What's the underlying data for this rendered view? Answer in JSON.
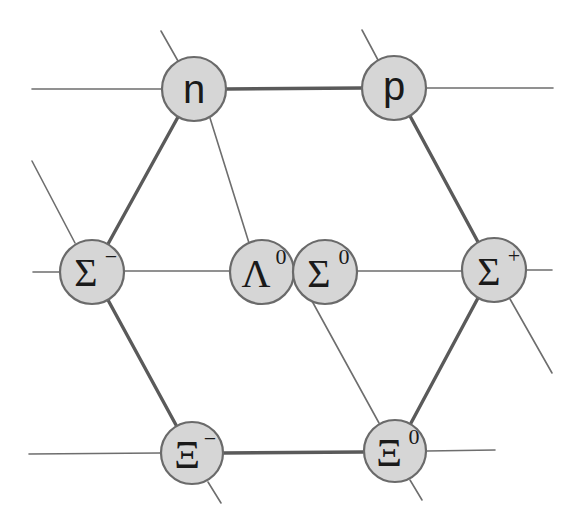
{
  "diagram": {
    "title": "",
    "colors": {
      "background": "#ffffff",
      "node_fill": "#d6d6d6",
      "node_stroke": "#6a6a6a",
      "line": "#6e6e6e",
      "text": "#1a1a1a"
    },
    "nodes": [
      {
        "id": "n",
        "symbol": "n",
        "superscript": "",
        "x": 194,
        "y": 89
      },
      {
        "id": "p",
        "symbol": "p",
        "superscript": "",
        "x": 394,
        "y": 88
      },
      {
        "id": "sigma-minus",
        "symbol": "Σ",
        "superscript": "−",
        "x": 92,
        "y": 272
      },
      {
        "id": "lambda-zero",
        "symbol": "Λ",
        "superscript": "0",
        "x": 262,
        "y": 272
      },
      {
        "id": "sigma-zero",
        "symbol": "Σ",
        "superscript": "0",
        "x": 325,
        "y": 272
      },
      {
        "id": "sigma-plus",
        "symbol": "Σ",
        "superscript": "+",
        "x": 494,
        "y": 270
      },
      {
        "id": "xi-minus",
        "symbol": "Ξ",
        "superscript": "−",
        "x": 192,
        "y": 453
      },
      {
        "id": "xi-zero",
        "symbol": "Ξ",
        "superscript": "0",
        "x": 395,
        "y": 451
      }
    ],
    "thick_edges": [
      [
        "n",
        "p"
      ],
      [
        "p",
        "sigma-plus"
      ],
      [
        "sigma-plus",
        "xi-zero"
      ],
      [
        "xi-zero",
        "xi-minus"
      ],
      [
        "xi-minus",
        "sigma-minus"
      ],
      [
        "sigma-minus",
        "n"
      ]
    ]
  }
}
